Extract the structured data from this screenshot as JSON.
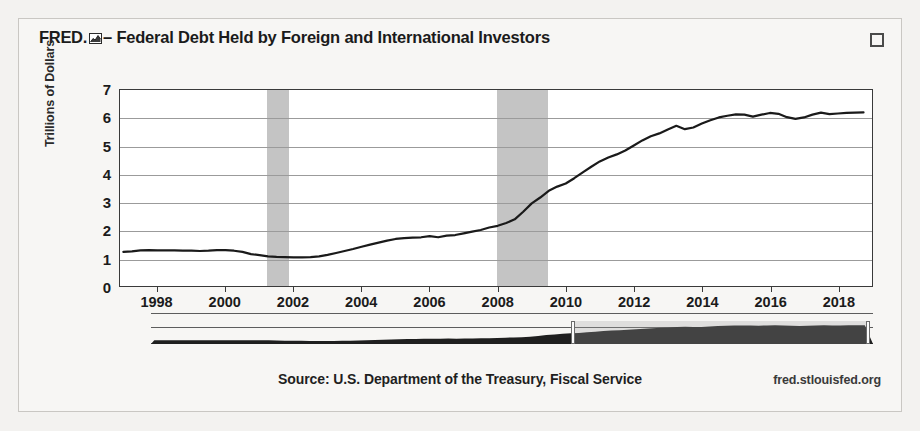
{
  "card": {
    "brand": "FRED.",
    "brand_icon": "fred-chart-logo-icon",
    "title_separator": "–",
    "title": "Federal Debt Held by Foreign and International Investors",
    "expand_icon": "fullscreen-expand-icon"
  },
  "footer": {
    "source": "Source: U.S. Department of the Treasury, Fiscal Service",
    "url": "fred.stlouisfed.org"
  },
  "range_selector": {
    "selection_start_label": "2008",
    "selection_end_label": "2018",
    "left_handle_pct": 58.4,
    "right_handle_pct": 99.3
  },
  "colors": {
    "line": "#1a1a1a",
    "recession_band": "#c4c4c4",
    "gridline": "#9b9b9b",
    "plot_background": "#ffffff",
    "card_background": "#f7f6f4",
    "page_background": "#f3f2f0",
    "text": "#1b1b1b"
  },
  "chart_data": {
    "type": "line",
    "title": "Federal Debt Held by Foreign and International Investors",
    "xlabel": "",
    "ylabel": "Trillions of Dollars",
    "xlim": [
      1996.9,
      2019.0
    ],
    "ylim": [
      0,
      7
    ],
    "yticks": [
      7,
      6,
      5,
      4,
      3,
      2,
      1,
      0
    ],
    "xticks": [
      1998,
      2000,
      2002,
      2004,
      2006,
      2008,
      2010,
      2012,
      2014,
      2016,
      2018
    ],
    "grid": true,
    "legend": false,
    "units": "Trillions of Dollars",
    "recession_bands": [
      {
        "start": 2001.2,
        "end": 2001.85
      },
      {
        "start": 2007.95,
        "end": 2009.45
      }
    ],
    "series": [
      {
        "name": "Federal Debt Held by Foreign and International Investors",
        "x": [
          1997.0,
          1997.25,
          1997.5,
          1997.75,
          1998.0,
          1998.25,
          1998.5,
          1998.75,
          1999.0,
          1999.25,
          1999.5,
          1999.75,
          2000.0,
          2000.25,
          2000.5,
          2000.75,
          2001.0,
          2001.25,
          2001.5,
          2001.75,
          2002.0,
          2002.25,
          2002.5,
          2002.75,
          2003.0,
          2003.25,
          2003.5,
          2003.75,
          2004.0,
          2004.25,
          2004.5,
          2004.75,
          2005.0,
          2005.25,
          2005.5,
          2005.75,
          2006.0,
          2006.25,
          2006.5,
          2006.75,
          2007.0,
          2007.25,
          2007.5,
          2007.75,
          2008.0,
          2008.25,
          2008.5,
          2008.75,
          2009.0,
          2009.25,
          2009.5,
          2009.75,
          2010.0,
          2010.25,
          2010.5,
          2010.75,
          2011.0,
          2011.25,
          2011.5,
          2011.75,
          2012.0,
          2012.25,
          2012.5,
          2012.75,
          2013.0,
          2013.25,
          2013.5,
          2013.75,
          2014.0,
          2014.25,
          2014.5,
          2014.75,
          2015.0,
          2015.25,
          2015.5,
          2015.75,
          2016.0,
          2016.25,
          2016.5,
          2016.75,
          2017.0,
          2017.25,
          2017.5,
          2017.75,
          2018.0,
          2018.25,
          2018.5,
          2018.75
        ],
        "y": [
          1.22,
          1.24,
          1.27,
          1.28,
          1.27,
          1.27,
          1.27,
          1.26,
          1.26,
          1.25,
          1.26,
          1.28,
          1.28,
          1.26,
          1.22,
          1.14,
          1.1,
          1.06,
          1.04,
          1.03,
          1.02,
          1.02,
          1.03,
          1.06,
          1.11,
          1.18,
          1.25,
          1.32,
          1.4,
          1.48,
          1.55,
          1.62,
          1.68,
          1.71,
          1.73,
          1.74,
          1.78,
          1.74,
          1.8,
          1.82,
          1.88,
          1.94,
          2.0,
          2.09,
          2.15,
          2.25,
          2.38,
          2.65,
          2.95,
          3.16,
          3.4,
          3.55,
          3.66,
          3.85,
          4.06,
          4.26,
          4.45,
          4.59,
          4.7,
          4.84,
          5.02,
          5.2,
          5.35,
          5.45,
          5.59,
          5.72,
          5.6,
          5.66,
          5.8,
          5.92,
          6.02,
          6.08,
          6.13,
          6.12,
          6.05,
          6.12,
          6.18,
          6.15,
          6.03,
          5.97,
          6.02,
          6.12,
          6.19,
          6.14,
          6.16,
          6.18,
          6.19,
          6.2
        ]
      }
    ]
  }
}
